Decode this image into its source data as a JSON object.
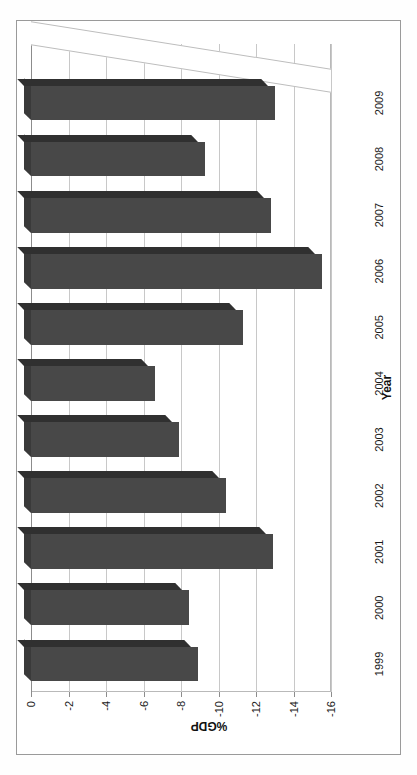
{
  "chart_data": {
    "type": "bar",
    "orientation": "vertical",
    "title": "",
    "xlabel": "Year",
    "ylabel": "%GDP",
    "categories": [
      "1999",
      "2000",
      "2001",
      "2002",
      "2003",
      "2004",
      "2005",
      "2006",
      "2007",
      "2008",
      "2009"
    ],
    "values": [
      -8.9,
      -8.4,
      -12.9,
      -10.4,
      -7.9,
      -6.6,
      -11.3,
      -15.5,
      -12.8,
      -9.3,
      -13.0
    ],
    "ylim": [
      -16,
      0
    ],
    "ytick_labels": [
      "0",
      "-2",
      "-4",
      "-6",
      "-8",
      "-10",
      "-12",
      "-14",
      "-16"
    ],
    "ytick_values": [
      0,
      -2,
      -4,
      -6,
      -8,
      -10,
      -12,
      -14,
      -16
    ],
    "grid": true,
    "legend": null,
    "series_color": "#484848",
    "rotation_deg": -90,
    "style": "3d-bar"
  },
  "axes": {
    "y_title": "%GDP",
    "x_title": "Year"
  },
  "colors": {
    "bar": "#484848",
    "bar_top": "#3a3a3a",
    "bar_side": "#303030",
    "grid": "#c8c8c8",
    "frame": "#9a9a9a",
    "text": "#1a1a1a",
    "background": "#ffffff"
  }
}
